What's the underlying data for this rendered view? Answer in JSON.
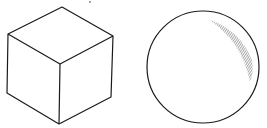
{
  "figure": {
    "background": "#ffffff",
    "stroke_color": "#1a1a1a",
    "hatch_color": "#555555",
    "shapes": [
      {
        "name": "cube",
        "label": "Cube (isometric line drawing)"
      },
      {
        "name": "sphere",
        "label": "Sphere with hatched highlight"
      }
    ]
  }
}
